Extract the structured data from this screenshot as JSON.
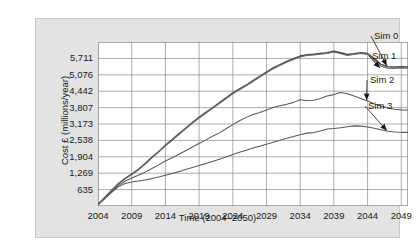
{
  "chart_data": {
    "type": "line",
    "title": "",
    "xlabel": "Time (2004–2050)",
    "ylabel": "Cost £ (millions/year)",
    "grid": true,
    "legend_position": "right-inline-annotations",
    "xlim": [
      2004,
      2050
    ],
    "ylim": [
      0,
      6346
    ],
    "xticks": [
      "2004",
      "2009",
      "2014",
      "2019",
      "2024",
      "2029",
      "2034",
      "2039",
      "2044",
      "2049"
    ],
    "xtick_values": [
      2004,
      2009,
      2014,
      2019,
      2024,
      2029,
      2034,
      2039,
      2044,
      2049
    ],
    "yticks": [
      "635",
      "1,269",
      "1,904",
      "2,538",
      "3,173",
      "3,807",
      "4,442",
      "5,076",
      "5,711"
    ],
    "ytick_values": [
      635,
      1269,
      1904,
      2538,
      3173,
      3807,
      4442,
      5076,
      5711
    ],
    "x": [
      2004,
      2005,
      2006,
      2007,
      2008,
      2009,
      2010,
      2011,
      2012,
      2013,
      2014,
      2015,
      2016,
      2017,
      2018,
      2019,
      2020,
      2021,
      2022,
      2023,
      2024,
      2025,
      2026,
      2027,
      2028,
      2029,
      2030,
      2031,
      2032,
      2033,
      2034,
      2035,
      2036,
      2037,
      2038,
      2039,
      2040,
      2041,
      2042,
      2043,
      2044,
      2045,
      2046,
      2047,
      2048,
      2049,
      2050
    ],
    "series": [
      {
        "name": "Sim 0",
        "color": "#4a4a4a",
        "values": [
          60,
          330,
          600,
          860,
          1060,
          1230,
          1420,
          1640,
          1880,
          2110,
          2350,
          2570,
          2790,
          3010,
          3230,
          3430,
          3620,
          3800,
          3990,
          4180,
          4380,
          4530,
          4680,
          4850,
          5020,
          5180,
          5340,
          5470,
          5590,
          5700,
          5800,
          5850,
          5870,
          5900,
          5930,
          5990,
          5930,
          5860,
          5890,
          5930,
          5900,
          5700,
          5480,
          5390,
          5380,
          5390,
          5380
        ]
      },
      {
        "name": "Sim 1",
        "color": "#6e6e6e",
        "values": [
          55,
          320,
          585,
          845,
          1045,
          1215,
          1400,
          1620,
          1860,
          2090,
          2325,
          2545,
          2765,
          2985,
          3200,
          3400,
          3590,
          3775,
          3965,
          4150,
          4345,
          4500,
          4650,
          4820,
          4990,
          5150,
          5310,
          5440,
          5560,
          5670,
          5770,
          5820,
          5840,
          5870,
          5900,
          5955,
          5895,
          5825,
          5860,
          5900,
          5865,
          5640,
          5410,
          5330,
          5325,
          5340,
          5335
        ]
      },
      {
        "name": "Sim 2",
        "color": "#5a5a5a",
        "values": [
          50,
          300,
          545,
          790,
          960,
          1080,
          1190,
          1310,
          1450,
          1590,
          1740,
          1870,
          2000,
          2140,
          2280,
          2420,
          2560,
          2700,
          2830,
          2990,
          3150,
          3300,
          3430,
          3540,
          3620,
          3710,
          3810,
          3880,
          3940,
          4010,
          4110,
          4080,
          4090,
          4160,
          4260,
          4310,
          4390,
          4340,
          4260,
          4160,
          4060,
          3960,
          3870,
          3790,
          3740,
          3720,
          3715
        ]
      },
      {
        "name": "Sim 3",
        "color": "#5a5a5a",
        "values": [
          45,
          290,
          520,
          740,
          870,
          930,
          970,
          1010,
          1060,
          1120,
          1190,
          1260,
          1330,
          1410,
          1490,
          1570,
          1640,
          1720,
          1810,
          1900,
          1990,
          2080,
          2160,
          2240,
          2310,
          2390,
          2470,
          2540,
          2620,
          2690,
          2760,
          2820,
          2840,
          2900,
          2980,
          3000,
          3030,
          3070,
          3100,
          3090,
          3060,
          3010,
          2950,
          2890,
          2860,
          2850,
          2850
        ]
      }
    ],
    "annotations": [
      {
        "label": "Sim 0",
        "target_x": 2047,
        "target_y": 5390
      },
      {
        "label": "Sim 1",
        "target_x": 2046,
        "target_y": 5300
      },
      {
        "label": "Sim 2",
        "target_x": 2044,
        "target_y": 4060
      },
      {
        "label": "Sim 3",
        "target_x": 2047,
        "target_y": 2880
      }
    ]
  }
}
